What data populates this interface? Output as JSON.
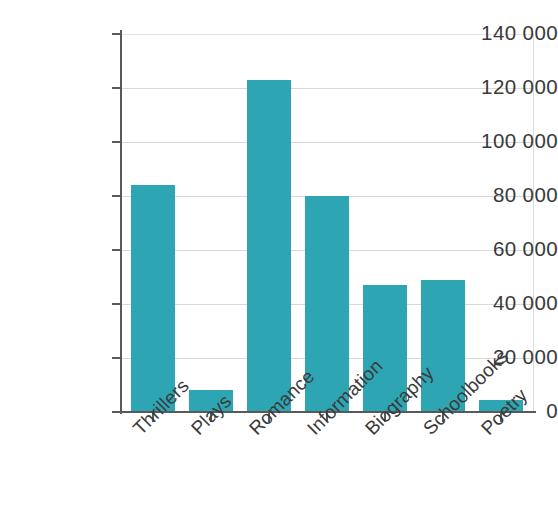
{
  "chart_data": {
    "type": "bar",
    "title": "",
    "subtitle": "",
    "xlabel": "",
    "ylabel": "",
    "categories": [
      "Thrillers",
      "Plays",
      "Romance",
      "Information",
      "Biography",
      "Schoolbooks",
      "Poetry"
    ],
    "values": [
      84000,
      8000,
      123000,
      80000,
      47000,
      49000,
      4500
    ],
    "ylim": [
      0,
      140000
    ],
    "ytick_values": [
      0,
      20000,
      40000,
      60000,
      80000,
      100000,
      120000,
      140000
    ],
    "ytick_labels": [
      "0",
      "20 000",
      "40 000",
      "60 000",
      "80 000",
      "100 000",
      "120 000",
      "140 000"
    ],
    "grid": true,
    "grid_axis": "y",
    "legend": null,
    "legend_position": "none",
    "series": [
      {
        "name": "Books sold",
        "color": "#2ea5b3",
        "values": [
          84000,
          8000,
          123000,
          80000,
          47000,
          49000,
          4500
        ]
      }
    ],
    "bar_color": "#2ea5b3",
    "axis_color": "#58595b",
    "grid_color": "#d8d8d8",
    "text_color": "#3a3a3a",
    "background": "#ffffff",
    "xtick_label_rotation": -45,
    "annotations": []
  }
}
